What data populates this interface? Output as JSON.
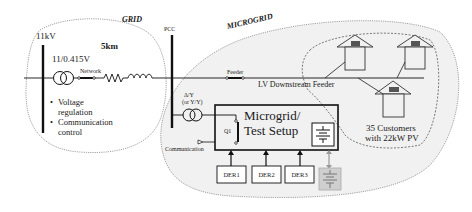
{
  "regions": {
    "grid": {
      "label": "GRID"
    },
    "microgrid": {
      "label": "MICROGRID"
    },
    "customers": {
      "label_line1": "35 Customers",
      "label_line2": "with 22kW PV"
    }
  },
  "grid_side": {
    "voltage": "11kV",
    "transformer_rating": "11/0.415V",
    "distance": "5km",
    "network_label": "Network",
    "bullets": [
      "Voltage regulation",
      "Communication control"
    ]
  },
  "pcc": {
    "label": "PCC"
  },
  "feeder": {
    "feeder_label": "Feeder",
    "downstream_label": "LV Downstream Feeder"
  },
  "microgrid_side": {
    "transformer_label_line1": "Δ/Y",
    "transformer_label_line2": "(or Y/Y)",
    "switch_label": "Q1",
    "setup_title_line1": "Microgrid/",
    "setup_title_line2": "Test Setup",
    "communication_label": "Communication",
    "ders": [
      "DER1",
      "DER2",
      "DER3"
    ]
  },
  "colors": {
    "line": "#1a1a1a",
    "microgrid_fill": "#f1f1f1",
    "dotted_border": "#8a8a8a",
    "pv_panel": "#555555",
    "storage_fill": "#cfcfcf"
  }
}
